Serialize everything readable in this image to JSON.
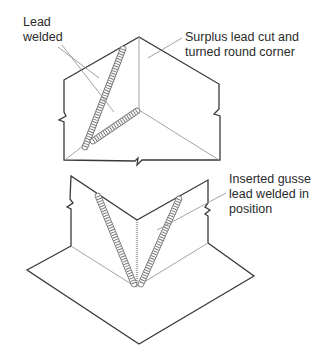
{
  "diagram": {
    "colors": {
      "outline": "#3a3a3a",
      "thin_line": "#9a9a9a",
      "weld": "#6e6e6e",
      "text": "#2a2a2a"
    },
    "labels": {
      "lead_welded": {
        "lines": [
          "Lead",
          "welded"
        ],
        "x": 23,
        "y": 15
      },
      "surplus_lead": {
        "lines": [
          "Surplus lead cut and",
          "turned round corner"
        ],
        "x": 185,
        "y": 30
      },
      "inserted_gusset": {
        "lines": [
          "Inserted gusset",
          "lead welded in",
          "position"
        ],
        "x": 229,
        "y": 172
      }
    },
    "upper_figure": {
      "description": "External corner with surplus lead cut and turned round corner, lead welded seams"
    },
    "lower_figure": {
      "description": "Internal corner with inserted gusset lead welded in position"
    }
  }
}
